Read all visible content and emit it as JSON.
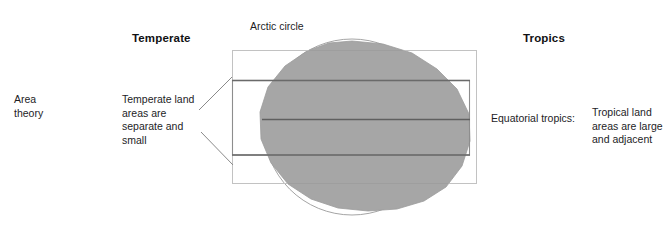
{
  "figure": {
    "title": "Area theory",
    "width": 667,
    "height": 228,
    "background": "#ffffff"
  },
  "labels": {
    "area_theory": "Area\ntheory",
    "temperate_heading": "Temperate",
    "tropics_heading": "Tropics",
    "arctic_circle": "Arctic circle",
    "temperate_description": "Temperate land\nareas  are\nseparate and\nsmall",
    "equatorial_tropics": "Equatorial tropics:",
    "tropical_description": "Tropical land\nareas are large\nand adjacent"
  },
  "diagram": {
    "type": "schematic",
    "globe": {
      "center_x": 352,
      "center_y": 127,
      "radius": 88,
      "fill": "#a6a6a6",
      "outline": "#8c8c8c"
    },
    "latitude_lines": [
      {
        "name": "arctic-circle-line",
        "y": 80,
        "weight": "heavy",
        "color": "#5f5f5f"
      },
      {
        "name": "equator-line",
        "y": 119,
        "weight": "heavy",
        "color": "#5f5f5f"
      },
      {
        "name": "tropic-line",
        "y": 155,
        "weight": "heavy",
        "color": "#5f5f5f"
      },
      {
        "name": "upper-band-line",
        "y": 50,
        "weight": "light",
        "color": "#b8b8b8"
      },
      {
        "name": "lower-band-line",
        "y": 183,
        "weight": "light",
        "color": "#b8b8b8"
      }
    ],
    "bands": [
      {
        "name": "outer-band-rect",
        "x": 232,
        "y": 50,
        "width": 245,
        "height": 133,
        "stroke": "#bdbdbd"
      },
      {
        "name": "inner-band-rect",
        "x": 232,
        "y": 80,
        "width": 238,
        "height": 75,
        "stroke": "#8a8a8a"
      }
    ],
    "connectors": [
      {
        "name": "upper-connector",
        "x1": 199,
        "y1": 110,
        "x2": 232,
        "y2": 77
      },
      {
        "name": "lower-connector",
        "x1": 201,
        "y1": 132,
        "x2": 233,
        "y2": 165
      }
    ]
  },
  "colors": {
    "globe_fill": "#a6a6a6",
    "globe_outline": "#8c8c8c",
    "heavy_line": "#5f5f5f",
    "light_line": "#bdbdbd",
    "text": "#1d1d1f",
    "background": "#ffffff"
  }
}
